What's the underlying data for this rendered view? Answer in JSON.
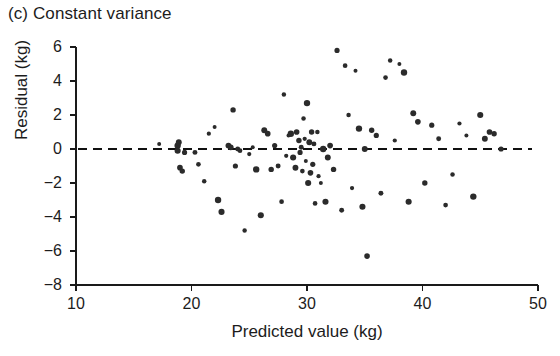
{
  "figure": {
    "panel_label": "(c) Constant variance",
    "xlabel": "Predicted value (kg)",
    "ylabel": "Residual (kg)",
    "point_color": "#2b2b2b",
    "axis_color": "#1a1a1a",
    "zero_line_color": "#111111"
  },
  "chart_data": {
    "type": "scatter",
    "title": "(c) Constant variance",
    "xlabel": "Predicted value (kg)",
    "ylabel": "Residual (kg)",
    "xlim": [
      10,
      50
    ],
    "ylim": [
      -8,
      6
    ],
    "xticks": [
      10,
      20,
      30,
      40,
      50
    ],
    "yticks": [
      6,
      4,
      2,
      0,
      -2,
      -4,
      -6,
      -8
    ],
    "xtick_labels": [
      "10",
      "20",
      "30",
      "40",
      "50"
    ],
    "ytick_labels": [
      "6",
      "4",
      "2",
      "0",
      "−2",
      "−4",
      "−6",
      "−8"
    ],
    "grid": false,
    "legend": null,
    "reference_lines": [
      {
        "orientation": "horizontal",
        "value": 0,
        "style": "dashed"
      }
    ],
    "annotations": [],
    "x": [
      17.2,
      18.8,
      18.8,
      18.9,
      19.0,
      19.2,
      19.4,
      20.3,
      20.6,
      21.1,
      21.5,
      22.0,
      22.3,
      22.6,
      23.2,
      23.4,
      23.6,
      23.8,
      24.0,
      24.2,
      24.6,
      25.0,
      25.3,
      25.6,
      26.0,
      26.3,
      26.6,
      26.9,
      27.2,
      27.5,
      27.8,
      28.0,
      28.2,
      28.4,
      28.6,
      28.8,
      29.0,
      29.1,
      29.3,
      29.4,
      29.5,
      29.6,
      29.7,
      29.8,
      29.9,
      30.0,
      30.1,
      30.2,
      30.3,
      30.4,
      30.5,
      30.6,
      30.7,
      30.9,
      31.0,
      31.2,
      31.4,
      31.6,
      31.8,
      32.0,
      32.3,
      32.6,
      33.0,
      33.3,
      33.6,
      33.9,
      34.2,
      34.5,
      34.8,
      35.0,
      35.2,
      35.6,
      36.0,
      36.4,
      36.8,
      37.2,
      37.6,
      38.0,
      38.4,
      38.8,
      39.2,
      39.6,
      40.2,
      40.8,
      41.4,
      42.0,
      42.6,
      43.2,
      43.8,
      44.4,
      45.0,
      45.4,
      45.8,
      46.2,
      46.8
    ],
    "y": [
      0.3,
      0.2,
      -0.1,
      0.4,
      -1.1,
      -1.3,
      -0.2,
      -0.2,
      -0.9,
      -1.9,
      0.9,
      1.3,
      -3.0,
      -3.7,
      0.2,
      0.1,
      2.3,
      -1.0,
      0.0,
      -0.1,
      -4.8,
      -0.3,
      0.1,
      -1.2,
      -3.9,
      1.1,
      0.9,
      -1.2,
      0.2,
      -1.0,
      -3.1,
      3.2,
      -0.4,
      0.8,
      0.9,
      -0.5,
      -1.1,
      1.0,
      0.5,
      -0.2,
      0.1,
      -1.3,
      1.8,
      0.6,
      -0.7,
      2.7,
      -2.0,
      0.4,
      -1.4,
      1.0,
      -0.9,
      0.3,
      -3.2,
      1.0,
      -1.6,
      -2.0,
      0.0,
      -3.1,
      -0.5,
      0.2,
      -1.2,
      5.8,
      -3.6,
      4.9,
      2.0,
      -2.3,
      4.6,
      1.2,
      -3.4,
      0.0,
      -6.3,
      1.1,
      0.8,
      -2.6,
      4.2,
      5.2,
      0.5,
      5.0,
      4.5,
      -3.1,
      2.1,
      1.6,
      -2.0,
      1.4,
      0.6,
      -3.3,
      -1.5,
      1.5,
      0.8,
      -2.8,
      2.0,
      0.6,
      1.0,
      0.9,
      0.0
    ]
  }
}
